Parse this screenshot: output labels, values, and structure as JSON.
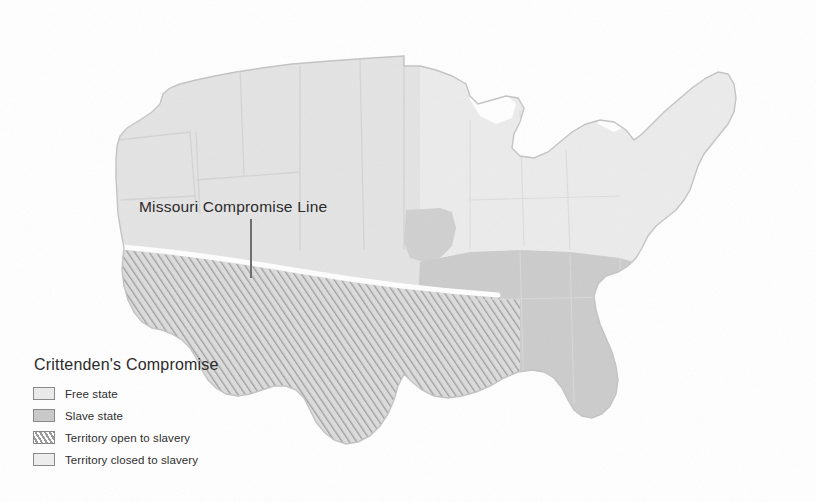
{
  "map": {
    "title_annotation": "Missouri Compromise Line",
    "subject": "United States",
    "background_color": "#ffffff",
    "regions": {
      "free_state_color": "#e9e9e9",
      "slave_state_color": "#c9c9c9",
      "territory_open_color": "#d6d6d6",
      "territory_closed_color": "#ededed",
      "compromise_line_color": "#ffffff",
      "border_color": "#b5b5b5"
    }
  },
  "annotation": {
    "label": "Missouri Compromise Line",
    "leader_line_color": "#6f6f6f"
  },
  "legend": {
    "title": "Crittenden's Compromise",
    "items": [
      {
        "label": "Free state",
        "swatch": "free-state-swatch"
      },
      {
        "label": "Slave state",
        "swatch": "slave-state-swatch"
      },
      {
        "label": "Territory open to slavery",
        "swatch": "territory-open-swatch"
      },
      {
        "label": "Territory closed to slavery",
        "swatch": "territory-closed-swatch"
      }
    ]
  }
}
